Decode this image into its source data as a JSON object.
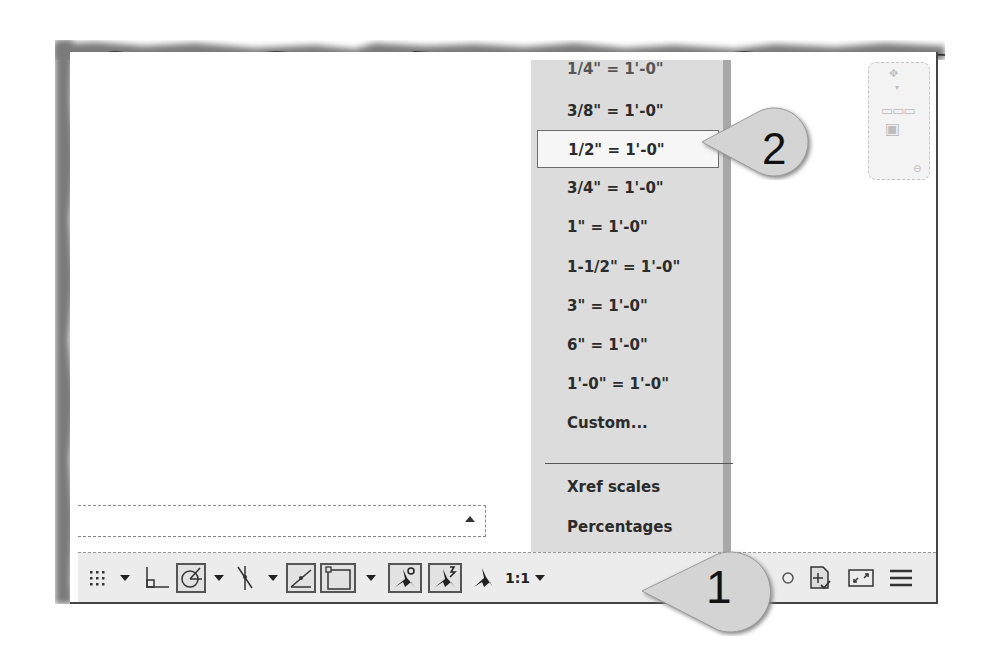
{
  "scale_menu": {
    "items": [
      {
        "label": "1/4\" = 1'-0\"",
        "partial": true
      },
      {
        "label": "3/8\" = 1'-0\""
      },
      {
        "label": "1/2\" = 1'-0\"",
        "selected": true
      },
      {
        "label": "3/4\" = 1'-0\""
      },
      {
        "label": "1\" = 1'-0\""
      },
      {
        "label": "1-1/2\" = 1'-0\""
      },
      {
        "label": "3\" = 1'-0\""
      },
      {
        "label": "6\" = 1'-0\""
      },
      {
        "label": "1'-0\" = 1'-0\""
      },
      {
        "label": "Custom..."
      },
      {
        "label": "Xref scales"
      },
      {
        "label": "Percentages"
      }
    ]
  },
  "status_bar": {
    "annotation_scale": "1:1",
    "tools": [
      "grid-display",
      "snap-mode-dropdown",
      "ortho-mode",
      "polar-tracking",
      "polar-dropdown",
      "isometric-drafting",
      "isodraft-dropdown",
      "object-snap-tracking",
      "object-snap",
      "osnap-dropdown",
      "annotation-visibility",
      "auto-scale",
      "annotation-scale-icon",
      "annotation-scale-dropdown",
      "workspace-switching",
      "annotation-monitor",
      "clean-screen",
      "customization-menu"
    ]
  },
  "command_line": {
    "value": ""
  },
  "callouts": {
    "one": "1",
    "two": "2"
  },
  "colors": {
    "menu_bg": "#dcdcdc",
    "menu_selected_bg": "#f6f6f6",
    "statusbar_bg": "#ececec",
    "callout_fill": "#d2d2d2"
  }
}
